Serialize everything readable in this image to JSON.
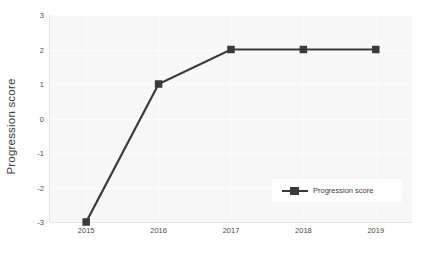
{
  "chart_data": {
    "type": "line",
    "title": "",
    "xlabel": "",
    "ylabel": "Progression score",
    "categories": [
      "2015",
      "2016",
      "2017",
      "2018",
      "2019"
    ],
    "x": [
      2015,
      2016,
      2017,
      2018,
      2019
    ],
    "series": [
      {
        "name": "Progression score",
        "values": [
          -3,
          1,
          2,
          2,
          2
        ],
        "color": "#3a3a3a",
        "marker": "square"
      }
    ],
    "ylim": [
      -3,
      3
    ],
    "yticks": [
      "3",
      "2",
      "1",
      "0",
      "-1",
      "-2",
      "-3"
    ],
    "ytick_values": [
      3,
      2,
      1,
      0,
      -1,
      -2,
      -3
    ],
    "xticks": [
      "2015",
      "2016",
      "2017",
      "2018",
      "2019"
    ],
    "grid": true,
    "grid_axis": "both",
    "legend": {
      "position": "lower right",
      "entries": [
        "Progression score"
      ]
    },
    "plot_background": "#f7f7f7",
    "figure_background": "#ffffff"
  },
  "axes": {
    "y_title": "Progression score"
  },
  "legend": {
    "label": "Progression score"
  },
  "caption": {
    "cut_text": ""
  }
}
